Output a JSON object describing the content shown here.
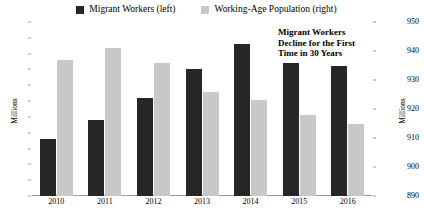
{
  "legend": {
    "entries": [
      {
        "label": "Migrant Workers (left)",
        "color": "#262626",
        "icon": "square-swatch-icon"
      },
      {
        "label": "Working-Age Population (right)",
        "color": "#c8c8c8",
        "icon": "square-swatch-icon"
      }
    ]
  },
  "annotation": {
    "line1": "Migrant Workers",
    "line2": "Decline for the First",
    "line3": "Time in 30 Years"
  },
  "axes": {
    "left_title": "Millions",
    "right_title": "Millions",
    "left_ticks": [
      "260",
      "255",
      "250",
      "245",
      "240",
      "235",
      "230",
      "225",
      "220",
      "215",
      "210",
      "205"
    ],
    "right_ticks": [
      "950",
      "940",
      "930",
      "920",
      "910",
      "900",
      "890"
    ]
  },
  "chart_data": {
    "type": "bar",
    "title": "",
    "subtitle": "",
    "xlabel": "",
    "ylabel": "Millions",
    "y2label": "Millions",
    "categories": [
      "2010",
      "2011",
      "2012",
      "2013",
      "2014",
      "2015",
      "2016"
    ],
    "series": [
      {
        "name": "Migrant Workers (left)",
        "axis": "left",
        "color": "#262626",
        "values": [
          223,
          229,
          236,
          245,
          253,
          247,
          246
        ]
      },
      {
        "name": "Working-Age Population (right)",
        "axis": "right",
        "color": "#c8c8c8",
        "values": [
          937,
          941,
          936,
          926,
          923,
          918,
          915
        ]
      }
    ],
    "ylim": [
      205,
      260
    ],
    "y2lim": [
      890,
      950
    ],
    "ytick_step": 5,
    "y2tick_step": 10,
    "grid": false,
    "legend_position": "top-center",
    "annotations": [
      {
        "text": "Migrant Workers Decline for the First Time in 30 Years",
        "target": "2015"
      }
    ]
  }
}
